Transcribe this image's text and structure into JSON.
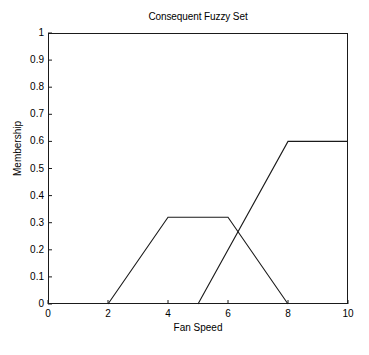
{
  "chart_data": {
    "type": "line",
    "title": "Consequent Fuzzy Set",
    "xlabel": "Fan Speed",
    "ylabel": "Membership",
    "xlim": [
      0,
      10
    ],
    "ylim": [
      0,
      1
    ],
    "xticks": [
      0,
      2,
      4,
      6,
      8,
      10
    ],
    "xtick_labels": [
      "0",
      "2",
      "4",
      "6",
      "8",
      "10"
    ],
    "yticks": [
      0,
      0.1,
      0.2,
      0.3,
      0.4,
      0.5,
      0.6,
      0.7,
      0.8,
      0.9,
      1
    ],
    "ytick_labels": [
      "0",
      "0.1",
      "0.2",
      "0.3",
      "0.4",
      "0.5",
      "0.6",
      "0.7",
      "0.8",
      "0.9",
      "1"
    ],
    "grid": false,
    "legend": false,
    "line_color": "#1a1a1a",
    "background_color": "#ffffff",
    "series": [
      {
        "name": "Medium fan speed (clipped trapezoid)",
        "clip_level": 0.32,
        "x": [
          2,
          4,
          6,
          8
        ],
        "y": [
          0,
          0.32,
          0.32,
          0
        ]
      },
      {
        "name": "High fan speed (clipped trapezoid)",
        "clip_level": 0.6,
        "x": [
          5,
          8,
          10
        ],
        "y": [
          0,
          0.6,
          0.6
        ]
      }
    ],
    "annotations": []
  }
}
